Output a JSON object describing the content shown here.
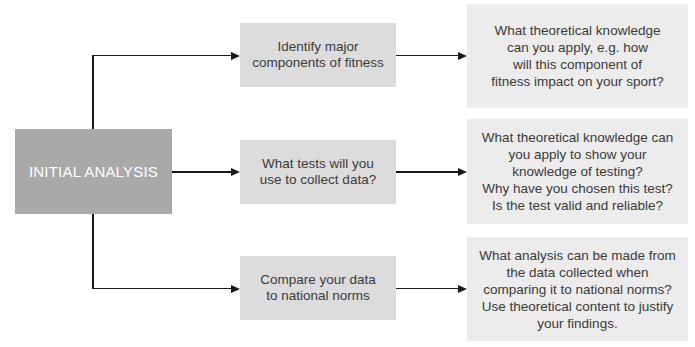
{
  "main": {
    "label": "INITIAL ANALYSIS"
  },
  "steps": [
    {
      "label": "Identify major\ncomponents of fitness",
      "detail": "What theoretical knowledge\ncan you apply, e.g. how\nwill this component of\nfitness impact on your sport?"
    },
    {
      "label": "What tests will you\nuse to collect data?",
      "detail": "What theoretical knowledge can\nyou apply to show your\nknowledge of testing?\nWhy have you chosen this test?\nIs the test valid and reliable?"
    },
    {
      "label": "Compare your data\nto national norms",
      "detail": "What analysis can be made from\nthe data collected when\ncomparing it to national norms?\nUse theoretical content to justify\nyour findings."
    }
  ],
  "colors": {
    "main_box": "#a9a9a9",
    "step_box": "#dcdcdc",
    "detail_box": "#ececec",
    "connector": "#1a1a1a"
  }
}
